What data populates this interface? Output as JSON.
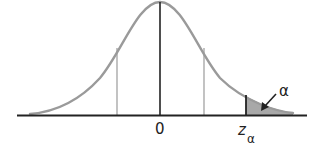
{
  "diagram": {
    "type": "normal-distribution-right-tail",
    "labels": {
      "center": "0",
      "critical": "z",
      "critical_subscript": "α",
      "tail_area": "α"
    },
    "colors": {
      "curve": "#9a9a9a",
      "axis": "#222222",
      "center_line": "#222222",
      "guide_lines": "#9a9a9a",
      "critical_line": "#222222",
      "tail_fill": "#a8a8a8",
      "text": "#222222"
    }
  }
}
